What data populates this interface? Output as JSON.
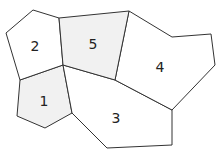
{
  "diagram": {
    "type": "region-map",
    "stroke_color": "#333333",
    "regions": [
      {
        "label": "1",
        "fill": "#f1f1f1",
        "points": "20,80 63,65 72,113 45,128 17,116",
        "label_pos": [
          44,
          106
        ]
      },
      {
        "label": "2",
        "fill": "#ffffff",
        "points": "33,10 59,18 63,65 20,80 6,33",
        "label_pos": [
          35,
          51
        ]
      },
      {
        "label": "3",
        "fill": "#ffffff",
        "points": "63,65 115,80 172,110 172,145 107,148 72,113",
        "label_pos": [
          116,
          123
        ]
      },
      {
        "label": "4",
        "fill": "#ffffff",
        "points": "129,11 172,37 211,34 215,65 172,110 115,80",
        "label_pos": [
          160,
          72
        ]
      },
      {
        "label": "5",
        "fill": "#f1f1f1",
        "points": "59,18 129,11 115,80 63,65",
        "label_pos": [
          93,
          49
        ]
      }
    ]
  }
}
